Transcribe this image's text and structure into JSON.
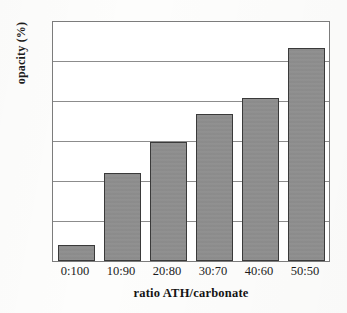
{
  "chart_data": {
    "type": "bar",
    "title": "",
    "categories": [
      "0:100",
      "10:90",
      "20:80",
      "30:70",
      "40:60",
      "50:50"
    ],
    "values": [
      12.0,
      21.0,
      24.9,
      28.5,
      30.5,
      36.8
    ],
    "xlabel": "ratio ATH/carbonate",
    "ylabel": "opacity (%)",
    "ylim": [
      10,
      40
    ],
    "yticks": [
      10,
      15,
      20,
      25,
      30,
      35,
      40
    ],
    "ytick_labels": [
      "10",
      "15",
      "20",
      "25",
      "30",
      "35",
      "40"
    ],
    "grid": true,
    "legend": "none",
    "bar_color": "#8e8e8e",
    "bar_edge_color": "#3a3a3a",
    "frame_color": "#7c7c7c",
    "gridline_color": "#8c8c8c",
    "background_color": "#ffffff"
  }
}
